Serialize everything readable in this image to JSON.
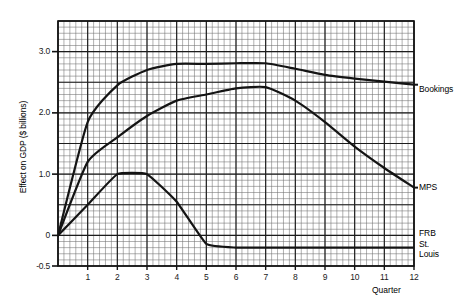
{
  "chart_data": {
    "type": "line",
    "title": "",
    "xlabel": "Quarter",
    "ylabel": "Effect on GDP ($ billions)",
    "xlim": [
      0,
      12
    ],
    "ylim": [
      -0.5,
      3.5
    ],
    "xticks": [
      "1",
      "2",
      "3",
      "4",
      "5",
      "6",
      "7",
      "8",
      "9",
      "10",
      "11",
      "12"
    ],
    "xtick_values": [
      1,
      2,
      3,
      4,
      5,
      6,
      7,
      8,
      9,
      10,
      11,
      12
    ],
    "yticks": [
      "3.0",
      "2.0",
      "1.0",
      "0",
      "-0.5"
    ],
    "ytick_values": [
      3.0,
      2.0,
      1.0,
      0,
      -0.5
    ],
    "grid": true,
    "grid_minor_step_x": 0.2,
    "grid_minor_step_y": 0.1,
    "grid_major_step_x": 1,
    "grid_major_step_y": 0.5,
    "legend_position": "right-inline-labels",
    "x": [
      0,
      1,
      2,
      3,
      4,
      5,
      6,
      7,
      8,
      9,
      10,
      11,
      12
    ],
    "series": [
      {
        "name": "Bookings",
        "color": "#141414",
        "values": [
          0.0,
          1.85,
          2.45,
          2.7,
          2.8,
          2.8,
          2.81,
          2.81,
          2.72,
          2.62,
          2.56,
          2.51,
          2.46
        ]
      },
      {
        "name": "MPS",
        "color": "#141414",
        "values": [
          0.0,
          1.2,
          1.6,
          1.95,
          2.2,
          2.3,
          2.4,
          2.42,
          2.2,
          1.85,
          1.45,
          1.1,
          0.78
        ]
      },
      {
        "name": "FRB St. Louis",
        "color": "#141414",
        "values": [
          0.0,
          0.5,
          1.0,
          1.0,
          0.55,
          -0.14,
          -0.2,
          -0.2,
          -0.2,
          -0.2,
          -0.2,
          -0.2,
          -0.2
        ]
      }
    ],
    "annotations": [
      {
        "id": "bookings",
        "text": "Bookings"
      },
      {
        "id": "mps",
        "text": "MPS"
      },
      {
        "id": "frb",
        "line1": "FRB",
        "line2": "St.",
        "line3": "Louis"
      }
    ]
  }
}
